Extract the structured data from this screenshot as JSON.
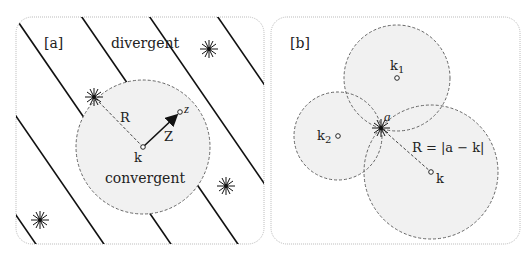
{
  "colors": {
    "ink": "#111111",
    "circle_fill": "#f1f1f1",
    "circle_stroke": "#666666",
    "panel_border": "#bbbbbb"
  },
  "panel_a": {
    "tag": "[a]",
    "region_outside_label": "divergent",
    "region_inside_label": "convergent",
    "center_label": "k",
    "point_label": "z",
    "radius_label": "R",
    "vector_label": "Z",
    "circle": {
      "cx": 143,
      "cy": 147,
      "r": 67
    },
    "singularities": [
      {
        "x": 94,
        "y": 97
      },
      {
        "x": 209,
        "y": 49
      },
      {
        "x": 226,
        "y": 186
      },
      {
        "x": 40,
        "y": 220
      }
    ],
    "point_z": {
      "x": 180,
      "y": 112
    }
  },
  "panel_b": {
    "tag": "[b]",
    "singularity_label": "a",
    "center_labels": [
      "k",
      "1",
      "k",
      "2",
      "k"
    ],
    "k1_label": "k",
    "k1_sub": "1",
    "k2_label": "k",
    "k2_sub": "2",
    "k_label": "k",
    "radius_formula": "R = |a − k|",
    "circles": [
      {
        "name": "k1",
        "cx": 397,
        "cy": 78,
        "r": 53
      },
      {
        "name": "k2",
        "cx": 338,
        "cy": 136,
        "r": 44
      },
      {
        "name": "k",
        "cx": 431,
        "cy": 172,
        "r": 67
      }
    ],
    "singularity": {
      "x": 381,
      "y": 128
    }
  }
}
